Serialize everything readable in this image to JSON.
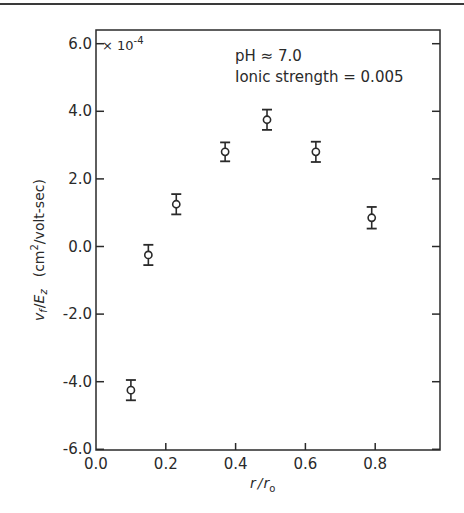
{
  "chart_data": {
    "type": "scatter",
    "title": "",
    "xlabel": "r / r₀",
    "ylabel": "v_f / E_z  (cm²/volt-sec)",
    "y_multiplier": "× 10⁻⁴",
    "xlim": [
      0.0,
      0.98
    ],
    "ylim": [
      -6.0,
      6.4
    ],
    "x_ticks": [
      "0.0",
      "0.2",
      "0.4",
      "0.6",
      "0.8"
    ],
    "y_ticks": [
      "6.0",
      "4.0",
      "2.0",
      "0.0",
      "-2.0",
      "-4.0",
      "-6.0"
    ],
    "grid": false,
    "legend": null,
    "annotations": [
      "pH ≈ 7.0",
      "Ionic strength = 0.005"
    ],
    "series": [
      {
        "name": "measured",
        "marker": "open-circle-with-error-bars",
        "x": [
          0.1,
          0.15,
          0.23,
          0.37,
          0.49,
          0.63,
          0.79
        ],
        "y": [
          -4.25,
          -0.25,
          1.25,
          2.8,
          3.75,
          2.8,
          0.85
        ],
        "error": [
          0.3,
          0.3,
          0.3,
          0.28,
          0.3,
          0.3,
          0.32
        ]
      }
    ]
  },
  "labels": {
    "y_multiplier_base": "× 10",
    "y_multiplier_exp": "-4",
    "annotation_ph": "pH ≈ 7.0",
    "annotation_ionic": "Ionic strength = 0.005",
    "xlabel_r": "r",
    "xlabel_sep": "/",
    "xlabel_r0": "r",
    "xlabel_sub": "o",
    "ylabel_main": "v",
    "ylabel_sub_f": "f",
    "ylabel_sep": "/",
    "ylabel_E": "E",
    "ylabel_sub_z": "z",
    "ylabel_units": "(cm",
    "ylabel_units_sup": "2",
    "ylabel_units_rest": "/volt-sec)"
  }
}
